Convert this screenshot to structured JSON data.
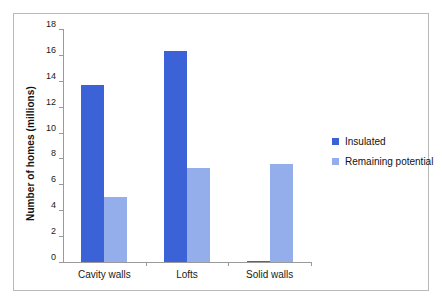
{
  "chart_data": {
    "type": "bar",
    "title": "",
    "xlabel": "",
    "ylabel": "Number of homes (millions)",
    "categories": [
      "Cavity walls",
      "Lofts",
      "Solid walls"
    ],
    "series": [
      {
        "name": "Insulated",
        "color": "#3b62d6",
        "values": [
          13.7,
          16.3,
          0.1
        ]
      },
      {
        "name": "Remaining potential",
        "color": "#93aeea",
        "values": [
          5.0,
          7.3,
          7.6
        ]
      }
    ],
    "ylim": [
      0,
      18
    ],
    "ytick_step": 2,
    "ytick_labels": [
      "0",
      "2",
      "4",
      "6",
      "8",
      "10",
      "12",
      "14",
      "16",
      "18"
    ],
    "grid": false,
    "legend_position": "right"
  },
  "frame": {
    "border_color": "#b9b9b9",
    "background": "#ffffff"
  }
}
